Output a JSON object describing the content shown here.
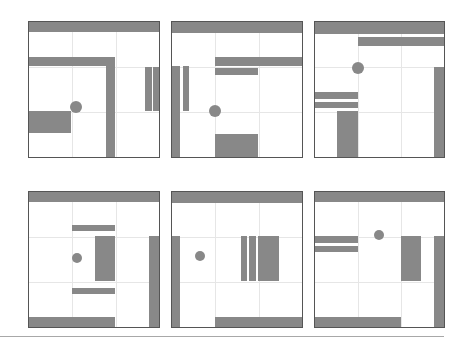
{
  "figure": {
    "colors": {
      "wall": "#888888",
      "border": "#555555",
      "grid": "#e6e6e6",
      "background": "#ffffff",
      "baseline": "#a8a8a8"
    },
    "grid": {
      "cols": 3,
      "rows": 3
    },
    "panels": [
      {
        "id": 1,
        "x": 28,
        "y": 21,
        "w": 132,
        "h": 137,
        "dot": {
          "cx": 48,
          "cy": 86,
          "r": 6
        },
        "bars": [
          {
            "x": 0,
            "y": 0,
            "w": 132,
            "h": 11
          },
          {
            "x": 0,
            "y": 36,
            "w": 87,
            "h": 9
          },
          {
            "x": 78,
            "y": 36,
            "w": 9,
            "h": 101
          },
          {
            "x": 117,
            "y": 46,
            "w": 7,
            "h": 44
          },
          {
            "x": 125,
            "y": 46,
            "w": 7,
            "h": 44
          },
          {
            "x": 0,
            "y": 90,
            "w": 43,
            "h": 22
          }
        ]
      },
      {
        "id": 2,
        "x": 171,
        "y": 21,
        "w": 132,
        "h": 137,
        "dot": {
          "cx": 44,
          "cy": 90,
          "r": 6
        },
        "bars": [
          {
            "x": 0,
            "y": 0,
            "w": 132,
            "h": 12
          },
          {
            "x": 44,
            "y": 36,
            "w": 88,
            "h": 9
          },
          {
            "x": 44,
            "y": 47,
            "w": 43,
            "h": 7
          },
          {
            "x": 0,
            "y": 45,
            "w": 9,
            "h": 92
          },
          {
            "x": 12,
            "y": 45,
            "w": 6,
            "h": 45
          },
          {
            "x": 44,
            "y": 113,
            "w": 43,
            "h": 24
          }
        ]
      },
      {
        "id": 3,
        "x": 314,
        "y": 21,
        "w": 131,
        "h": 137,
        "dot": {
          "cx": 44,
          "cy": 47,
          "r": 6
        },
        "bars": [
          {
            "x": 0,
            "y": 0,
            "w": 131,
            "h": 13
          },
          {
            "x": 44,
            "y": 16,
            "w": 87,
            "h": 9
          },
          {
            "x": 0,
            "y": 71,
            "w": 44,
            "h": 7
          },
          {
            "x": 0,
            "y": 81,
            "w": 44,
            "h": 6
          },
          {
            "x": 23,
            "y": 90,
            "w": 21,
            "h": 47
          },
          {
            "x": 120,
            "y": 46,
            "w": 11,
            "h": 91
          }
        ]
      },
      {
        "id": 4,
        "x": 28,
        "y": 191,
        "w": 132,
        "h": 137,
        "dot": {
          "cx": 49,
          "cy": 67,
          "r": 5
        },
        "bars": [
          {
            "x": 0,
            "y": 0,
            "w": 132,
            "h": 11
          },
          {
            "x": 44,
            "y": 34,
            "w": 43,
            "h": 6
          },
          {
            "x": 67,
            "y": 45,
            "w": 20,
            "h": 45
          },
          {
            "x": 44,
            "y": 97,
            "w": 43,
            "h": 6
          },
          {
            "x": 0,
            "y": 126,
            "w": 87,
            "h": 11
          },
          {
            "x": 121,
            "y": 45,
            "w": 11,
            "h": 92
          }
        ]
      },
      {
        "id": 5,
        "x": 171,
        "y": 191,
        "w": 132,
        "h": 137,
        "dot": {
          "cx": 29,
          "cy": 65,
          "r": 5
        },
        "bars": [
          {
            "x": 0,
            "y": 0,
            "w": 132,
            "h": 12
          },
          {
            "x": 0,
            "y": 45,
            "w": 9,
            "h": 92
          },
          {
            "x": 70,
            "y": 45,
            "w": 6,
            "h": 45
          },
          {
            "x": 78,
            "y": 45,
            "w": 7,
            "h": 45
          },
          {
            "x": 87,
            "y": 45,
            "w": 21,
            "h": 45
          },
          {
            "x": 44,
            "y": 126,
            "w": 88,
            "h": 11
          }
        ]
      },
      {
        "id": 6,
        "x": 314,
        "y": 191,
        "w": 131,
        "h": 137,
        "dot": {
          "cx": 65,
          "cy": 44,
          "r": 5
        },
        "bars": [
          {
            "x": 0,
            "y": 0,
            "w": 131,
            "h": 11
          },
          {
            "x": 0,
            "y": 45,
            "w": 44,
            "h": 7
          },
          {
            "x": 0,
            "y": 55,
            "w": 44,
            "h": 6
          },
          {
            "x": 87,
            "y": 45,
            "w": 20,
            "h": 45
          },
          {
            "x": 120,
            "y": 45,
            "w": 11,
            "h": 92
          },
          {
            "x": 0,
            "y": 126,
            "w": 87,
            "h": 11
          }
        ]
      }
    ]
  }
}
